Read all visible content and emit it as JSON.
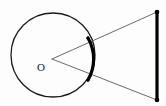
{
  "figure": {
    "type": "geometry-diagram",
    "canvas": {
      "width": 166,
      "height": 106,
      "background": "#fdfdfd"
    },
    "colors": {
      "stroke": "#1a1a1a",
      "thin_stroke": "#6b6b6b",
      "bold_stroke": "#000000",
      "label": "#1a1a1a",
      "background": "#fdfdfd"
    },
    "elements": {
      "circle": {
        "name": "circle",
        "cx": 53,
        "cy": 55,
        "r": 42,
        "stroke_width": 1.3,
        "fill": "none"
      },
      "center_label": {
        "name": "center-point-label",
        "text": "O",
        "x": 41,
        "y": 68
      },
      "vertex": {
        "name": "angle-vertex",
        "x": 52,
        "y": 59
      },
      "bold_arc": {
        "name": "highlighted-arc",
        "start_x": 88,
        "start_y": 38,
        "end_x": 88,
        "end_y": 80,
        "radius": 42,
        "stroke_width": 3.2,
        "sweep": 1,
        "large_arc": 0
      },
      "ray_upper": {
        "name": "upper-ray",
        "x1": 52,
        "y1": 59,
        "x2": 157,
        "y2": 12,
        "stroke_width": 1
      },
      "ray_lower": {
        "name": "lower-ray",
        "x1": 52,
        "y1": 59,
        "x2": 157,
        "y2": 100,
        "stroke_width": 1
      },
      "vertical_segment": {
        "name": "vertical-segment",
        "x1": 157,
        "y1": 12,
        "x2": 157,
        "y2": 100,
        "stroke_width": 3.2
      },
      "endpoint_top": {
        "name": "segment-endpoint-top",
        "cx": 157,
        "cy": 12,
        "r": 2.3
      },
      "endpoint_bottom": {
        "name": "segment-endpoint-bottom",
        "cx": 157,
        "cy": 100,
        "r": 2.3
      },
      "tangent_dot_top": {
        "name": "arc-tangent-dot-top",
        "cx": 88,
        "cy": 38,
        "r": 1.6
      },
      "tangent_dot_bottom": {
        "name": "arc-tangent-dot-bottom",
        "cx": 88,
        "cy": 80,
        "r": 1.6
      }
    }
  }
}
